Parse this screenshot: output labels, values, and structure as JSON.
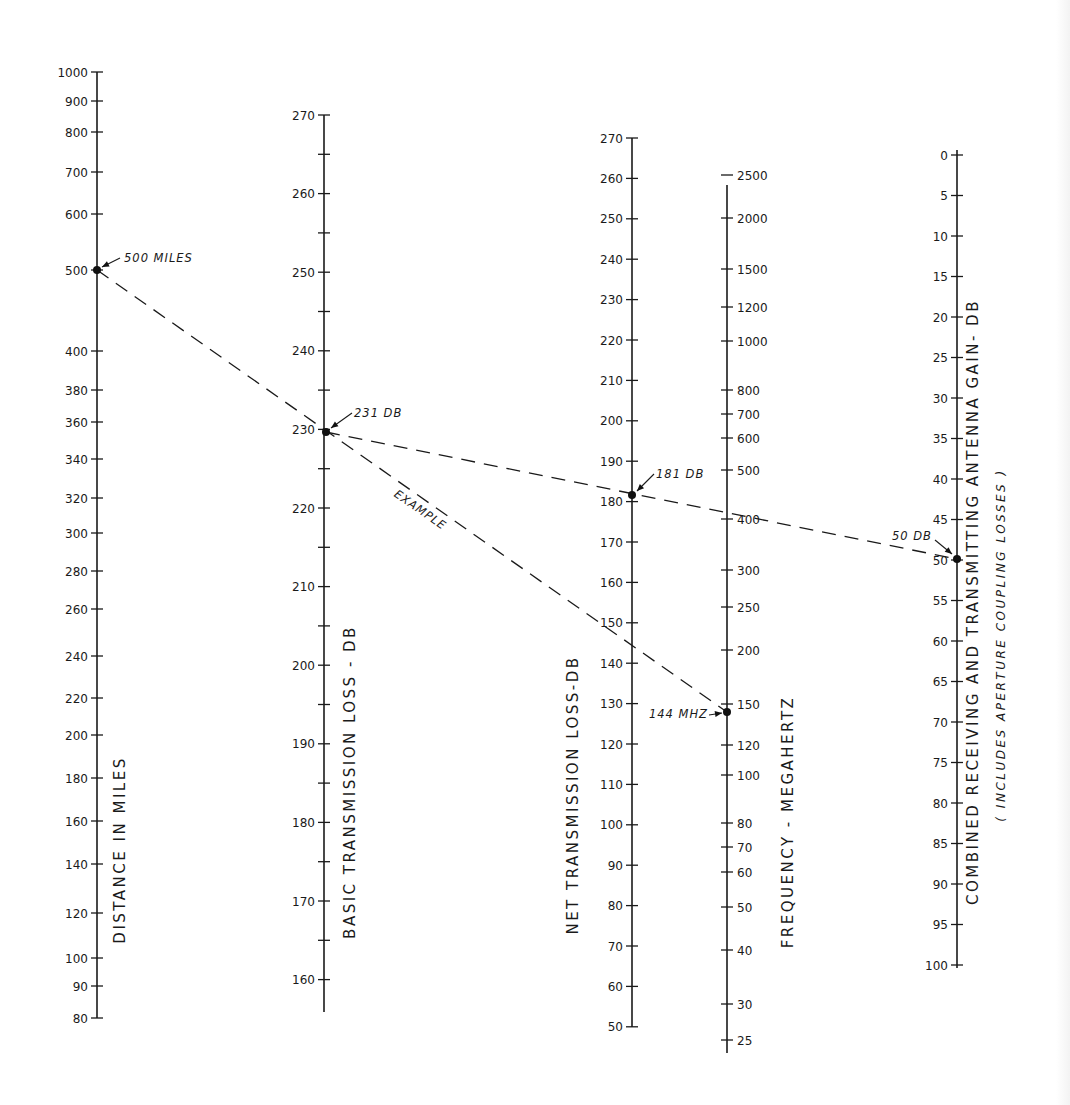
{
  "chart_data": {
    "type": "nomogram",
    "title": "",
    "axes": [
      {
        "id": "distance",
        "title": "DISTANCE IN MILES",
        "scale": "log",
        "range": [
          80,
          1000
        ],
        "x": 97,
        "line": [
          72,
          1018
        ],
        "ticks": [
          {
            "v": 1000,
            "y": 72
          },
          {
            "v": 900,
            "y": 101
          },
          {
            "v": 800,
            "y": 132
          },
          {
            "v": 700,
            "y": 172
          },
          {
            "v": 600,
            "y": 214
          },
          {
            "v": 500,
            "y": 270
          },
          {
            "v": 400,
            "y": 351
          },
          {
            "v": 380,
            "y": 390
          },
          {
            "v": 360,
            "y": 422
          },
          {
            "v": 340,
            "y": 459
          },
          {
            "v": 320,
            "y": 498
          },
          {
            "v": 300,
            "y": 533
          },
          {
            "v": 280,
            "y": 571
          },
          {
            "v": 260,
            "y": 609
          },
          {
            "v": 240,
            "y": 656
          },
          {
            "v": 220,
            "y": 698
          },
          {
            "v": 200,
            "y": 735
          },
          {
            "v": 180,
            "y": 778
          },
          {
            "v": 160,
            "y": 821
          },
          {
            "v": 140,
            "y": 864
          },
          {
            "v": 120,
            "y": 913
          },
          {
            "v": 100,
            "y": 958
          },
          {
            "v": 90,
            "y": 986
          },
          {
            "v": 80,
            "y": 1018
          }
        ],
        "label_pos": {
          "x": 125,
          "y": 850
        }
      },
      {
        "id": "basic_loss",
        "title": "BASIC TRANSMISSION LOSS - DB",
        "scale": "linear",
        "unit": "dB",
        "range": [
          160,
          270
        ],
        "x": 324,
        "line": [
          115,
          1012
        ],
        "major_ticks": [
          270,
          260,
          250,
          240,
          230,
          220,
          210,
          200,
          190,
          180,
          170,
          160
        ],
        "minor_step": 5,
        "y_at_270": 115,
        "px_per_db": 7.86,
        "label_pos": {
          "x": 355,
          "y": 782
        }
      },
      {
        "id": "net_loss",
        "title": "NET TRANSMISSION LOSS-DB",
        "scale": "linear",
        "unit": "dB",
        "range": [
          50,
          270
        ],
        "x": 632,
        "line": [
          138,
          1027
        ],
        "major_ticks": [
          270,
          260,
          250,
          240,
          230,
          220,
          210,
          200,
          190,
          180,
          170,
          160,
          150,
          140,
          130,
          120,
          110,
          100,
          90,
          80,
          70,
          60,
          50
        ],
        "y_at_270": 138,
        "px_per_db": 4.04,
        "label_pos": {
          "x": 578,
          "y": 795
        }
      },
      {
        "id": "frequency",
        "title": "FREQUENCY - MEGAHERTZ",
        "scale": "log",
        "unit": "MHz",
        "range": [
          25,
          2500
        ],
        "x": 727,
        "line": [
          185,
          1053
        ],
        "ticks": [
          {
            "v": 2500,
            "y": 175
          },
          {
            "v": 2000,
            "y": 218
          },
          {
            "v": 1500,
            "y": 269
          },
          {
            "v": 1200,
            "y": 307
          },
          {
            "v": 1000,
            "y": 341
          },
          {
            "v": 800,
            "y": 390
          },
          {
            "v": 700,
            "y": 414
          },
          {
            "v": 600,
            "y": 438
          },
          {
            "v": 500,
            "y": 470
          },
          {
            "v": 400,
            "y": 519
          },
          {
            "v": 300,
            "y": 570
          },
          {
            "v": 250,
            "y": 607
          },
          {
            "v": 200,
            "y": 650
          },
          {
            "v": 150,
            "y": 704
          },
          {
            "v": 120,
            "y": 745
          },
          {
            "v": 100,
            "y": 775
          },
          {
            "v": 80,
            "y": 823
          },
          {
            "v": 70,
            "y": 847
          },
          {
            "v": 60,
            "y": 872
          },
          {
            "v": 50,
            "y": 907
          },
          {
            "v": 40,
            "y": 950
          },
          {
            "v": 30,
            "y": 1004
          },
          {
            "v": 25,
            "y": 1040
          }
        ],
        "label_pos": {
          "x": 793,
          "y": 822
        }
      },
      {
        "id": "antenna_gain",
        "title": "COMBINED RECEIVING AND TRANSMITTING ANTENNA GAIN- DB",
        "subtitle": "( INCLUDES APERTURE COUPLING LOSSES )",
        "scale": "linear",
        "unit": "dB",
        "range": [
          0,
          100
        ],
        "inverted": true,
        "x": 957,
        "line": [
          150,
          968
        ],
        "major_ticks": [
          0,
          5,
          10,
          15,
          20,
          25,
          30,
          35,
          40,
          45,
          50,
          55,
          60,
          65,
          70,
          75,
          80,
          85,
          90,
          95,
          100
        ],
        "y_at_0": 155,
        "px_per_db": 8.1,
        "label_pos": {
          "x": 978,
          "y": 602
        },
        "subtitle_pos": {
          "x": 1005,
          "y": 645
        }
      }
    ],
    "example": {
      "label": "EXAMPLE",
      "points": [
        {
          "axis": "distance",
          "value": 500,
          "label": "500 MILES",
          "x": 97,
          "y": 270
        },
        {
          "axis": "basic_loss",
          "value": 231,
          "label": "231 DB",
          "x": 326,
          "y": 432
        },
        {
          "axis": "frequency",
          "value": 144,
          "label": "144 MHZ",
          "x": 727,
          "y": 712
        },
        {
          "axis": "net_loss",
          "value": 181,
          "label": "181 DB",
          "x": 632,
          "y": 495
        },
        {
          "axis": "antenna_gain",
          "value": 50,
          "label": "50 DB",
          "x": 957,
          "y": 559
        }
      ],
      "lines": [
        {
          "from": "distance",
          "to": "frequency",
          "via": "basic_loss"
        },
        {
          "from": "basic_loss",
          "to": "antenna_gain",
          "via": "net_loss"
        }
      ]
    },
    "xlabel": "",
    "ylabel": "",
    "grid": false,
    "legend": null
  }
}
